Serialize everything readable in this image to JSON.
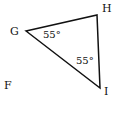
{
  "diagram": {
    "type": "geometry-triangle",
    "vertices": {
      "G": {
        "label": "G"
      },
      "H": {
        "label": "H"
      },
      "I": {
        "label": "I"
      }
    },
    "extra_point": {
      "label": "F"
    },
    "angles": {
      "G": "55°",
      "I": "55°"
    },
    "stroke_color": "#111111"
  }
}
